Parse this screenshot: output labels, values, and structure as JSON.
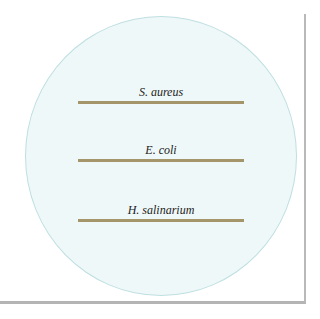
{
  "figure": {
    "type": "petri-dish-streak-plate",
    "streaks": [
      {
        "label": "S. aureus",
        "color": "#a4966a"
      },
      {
        "label": "E. coli",
        "color": "#a4966a"
      },
      {
        "label": "H. salinarium",
        "color": "#a4966a"
      }
    ],
    "dish_color": "#eff8f8",
    "dish_border": "#bfdfe2"
  }
}
